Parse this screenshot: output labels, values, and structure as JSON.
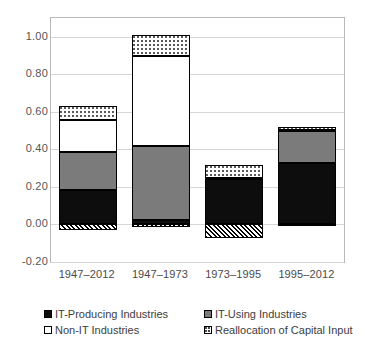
{
  "chart_data": {
    "type": "bar",
    "stacked": true,
    "title": "",
    "subtitle": "",
    "xlabel": "",
    "ylabel": "",
    "categories": [
      "1947–2012",
      "1947–1973",
      "1973–1995",
      "1995–2012"
    ],
    "ylim": [
      -0.2,
      1.1
    ],
    "yticks": [
      -0.2,
      0.0,
      0.2,
      0.4,
      0.6,
      0.8,
      1.0
    ],
    "ytick_labels": [
      "-0.20",
      "0.00",
      "0.20",
      "0.40",
      "0.60",
      "0.80",
      "1.00"
    ],
    "grid": true,
    "legend_position": "bottom",
    "series": [
      {
        "name": "IT-Producing Industries",
        "fill": "black",
        "values": [
          0.185,
          0.022,
          0.24,
          0.325
        ]
      },
      {
        "name": "IT-Using Industries",
        "fill": "gray",
        "values": [
          0.2,
          0.395,
          0.005,
          0.175
        ]
      },
      {
        "name": "Non-IT Industries",
        "fill": "white",
        "values": [
          0.17,
          0.478,
          0.0,
          0.005
        ]
      },
      {
        "name": "Reallocation of Capital Input",
        "fill": "dotted",
        "values": [
          0.075,
          0.115,
          0.07,
          0.015
        ]
      },
      {
        "name": "Reallocation of Capital Input (negative)",
        "fill": "hatch",
        "values": [
          -0.03,
          -0.015,
          -0.07,
          -0.01
        ]
      }
    ],
    "totals_positive": [
      0.63,
      1.01,
      0.315,
      0.52
    ],
    "totals_negative": [
      -0.03,
      -0.015,
      -0.07,
      -0.01
    ]
  },
  "legend": {
    "items": [
      {
        "label": "IT-Producing Industries",
        "swatch": "black-swatch-icon"
      },
      {
        "label": "IT-Using Industries",
        "swatch": "gray-swatch-icon"
      },
      {
        "label": "Non-IT Industries",
        "swatch": "white-swatch-icon"
      },
      {
        "label": "Reallocation of Capital Input",
        "swatch": "dotted-swatch-icon"
      }
    ]
  },
  "colors": {
    "it_producing": "#0d0d0d",
    "it_using": "#7b7b7b",
    "non_it": "#ffffff",
    "reallocation": "#ffffff",
    "gridline": "#d6d6d6",
    "axis_border": "#b9b9b9",
    "text": "#4a4a4a"
  }
}
